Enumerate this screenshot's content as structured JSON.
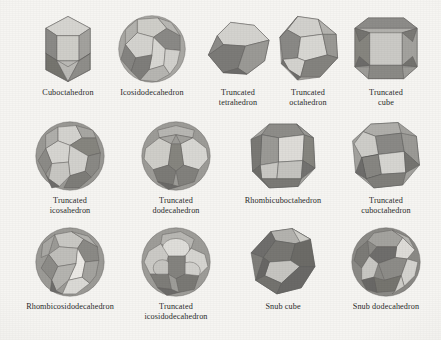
{
  "figure": {
    "background_color": "#f6f5f2",
    "label_color": "#2b2b2b",
    "palette": {
      "light": "#d6d5d1",
      "light_mid": "#c3c2be",
      "mid": "#a9a8a4",
      "mid_dark": "#949390",
      "dark": "#7e7d7a",
      "darkest": "#6a6967",
      "edge": "#5f5e5c"
    },
    "rows": [
      {
        "row_index": 1,
        "items": [
          {
            "name": "Cuboctahedron",
            "label": "Cuboctahedron",
            "icon": "cuboctahedron-icon",
            "center_x": 68,
            "center_y": 50,
            "size": 78
          },
          {
            "name": "Icosidodecahedron",
            "label": "Icosidodecahedron",
            "icon": "icosidodecahedron-icon",
            "center_x": 152,
            "center_y": 50,
            "size": 80
          },
          {
            "name": "Truncated tetrahedron",
            "label": "Truncated\ntetrahedron",
            "icon": "truncated-tetrahedron-icon",
            "center_x": 237,
            "center_y": 50,
            "size": 82
          },
          {
            "name": "Truncated octahedron",
            "label": "Truncated\noctahedron",
            "icon": "truncated-octahedron-icon",
            "center_x": 308,
            "center_y": 50,
            "size": 76
          },
          {
            "name": "Truncated cube",
            "label": "Truncated\ncube",
            "icon": "truncated-cube-icon",
            "center_x": 386,
            "center_y": 50,
            "size": 74
          }
        ]
      },
      {
        "row_index": 2,
        "items": [
          {
            "name": "Truncated icosahedron",
            "label": "Truncated\nicosahedron",
            "icon": "truncated-icosahedron-icon",
            "center_x": 70,
            "center_y": 158,
            "size": 80
          },
          {
            "name": "Truncated dodecahedron",
            "label": "Truncated\ndodecahedron",
            "icon": "truncated-dodecahedron-icon",
            "center_x": 176,
            "center_y": 158,
            "size": 80
          },
          {
            "name": "Rhombicuboctahedron",
            "label": "Rhombicuboctahedron",
            "icon": "rhombicuboctahedron-icon",
            "center_x": 283,
            "center_y": 158,
            "size": 78
          },
          {
            "name": "Truncated cuboctahedron",
            "label": "Truncated\ncuboctahedron",
            "icon": "truncated-cuboctahedron-icon",
            "center_x": 386,
            "center_y": 158,
            "size": 78
          }
        ]
      },
      {
        "row_index": 3,
        "items": [
          {
            "name": "Rhombicosidodecahedron",
            "label": "Rhombicosidodecahedron",
            "icon": "rhombicosidodecahedron-icon",
            "center_x": 70,
            "center_y": 264,
            "size": 78
          },
          {
            "name": "Truncated icosidodecahedron",
            "label": "Truncated\nicosidodecahedron",
            "icon": "truncated-icosidodecahedron-icon",
            "center_x": 176,
            "center_y": 264,
            "size": 78
          },
          {
            "name": "Snub cube",
            "label": "Snub cube",
            "icon": "snub-cube-icon",
            "center_x": 283,
            "center_y": 264,
            "size": 78
          },
          {
            "name": "Snub dodecahedron",
            "label": "Snub dodecahedron",
            "icon": "snub-dodecahedron-icon",
            "center_x": 386,
            "center_y": 264,
            "size": 78
          }
        ]
      }
    ]
  }
}
